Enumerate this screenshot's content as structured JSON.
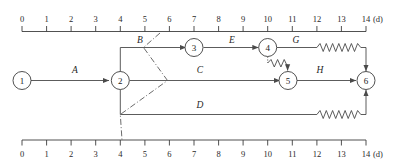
{
  "figure": {
    "kind": "time-scaled-network-diagram",
    "unit_label": "(d)",
    "colors": {
      "line": "#4a4a4a",
      "axis": "#3d3d3d",
      "text": "#222222",
      "background": "#ffffff"
    }
  },
  "axes": {
    "top": {
      "ticks": [
        "0",
        "1",
        "2",
        "3",
        "4",
        "5",
        "6",
        "7",
        "8",
        "9",
        "10",
        "11",
        "12",
        "13",
        "14"
      ],
      "unit": "(d)"
    },
    "bottom": {
      "ticks": [
        "0",
        "1",
        "2",
        "3",
        "4",
        "5",
        "6",
        "7",
        "8",
        "9",
        "10",
        "11",
        "12",
        "13",
        "14"
      ],
      "unit": "(d)"
    }
  },
  "nodes": [
    {
      "id": "1",
      "label": "1",
      "day": 0,
      "row": "mid"
    },
    {
      "id": "2",
      "label": "2",
      "day": 4,
      "row": "mid"
    },
    {
      "id": "3",
      "label": "3",
      "day": 7,
      "row": "top"
    },
    {
      "id": "4",
      "label": "4",
      "day": 10,
      "row": "top"
    },
    {
      "id": "5",
      "label": "5",
      "day": 11,
      "row": "mid"
    },
    {
      "id": "6",
      "label": "6",
      "day": 14,
      "row": "mid"
    }
  ],
  "activities": [
    {
      "name": "A",
      "label": "A",
      "from": "1",
      "to": "2",
      "start_day": 0,
      "end_day": 4,
      "duration": 4,
      "float": 0
    },
    {
      "name": "B",
      "label": "B",
      "from": "2",
      "to": "3",
      "start_day": 4,
      "end_day": 7,
      "duration": 3,
      "float": 0
    },
    {
      "name": "C",
      "label": "C",
      "from": "2",
      "to": "5",
      "start_day": 4,
      "end_day": 11,
      "duration": 7,
      "float": 0
    },
    {
      "name": "D",
      "label": "D",
      "from": "2",
      "to": "6",
      "start_day": 4,
      "end_day": 12,
      "duration": 8,
      "float": 2
    },
    {
      "name": "E",
      "label": "E",
      "from": "3",
      "to": "4",
      "start_day": 7,
      "end_day": 10,
      "duration": 3,
      "float": 0
    },
    {
      "name": "G",
      "label": "G",
      "from": "4",
      "to": "6",
      "start_day": 10,
      "end_day": 12,
      "duration": 2,
      "float": 2
    },
    {
      "name": "H",
      "label": "H",
      "from": "5",
      "to": "6",
      "start_day": 11,
      "end_day": 14,
      "duration": 3,
      "float": 0
    }
  ],
  "float_markers": [
    {
      "activity": "G",
      "from_day": 12,
      "to_day": 14,
      "style": "zigzag"
    },
    {
      "activity": "D",
      "from_day": 12,
      "to_day": 14,
      "style": "zigzag"
    },
    {
      "activity": "dummy-4-5",
      "from": "4",
      "to": "5",
      "style": "zigzag-dotted"
    }
  ],
  "boundary_line": {
    "name": "day-6-boundary",
    "style": "dash-dot",
    "label": ""
  }
}
